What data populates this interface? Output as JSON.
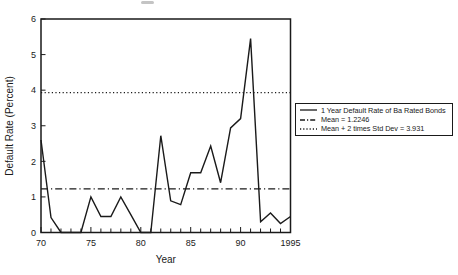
{
  "chart_data": {
    "type": "line",
    "xlabel": "Year",
    "ylabel": "Default Rate (Percent)",
    "xlim": [
      1970,
      1995
    ],
    "ylim": [
      0,
      6
    ],
    "x": [
      1970,
      1971,
      1972,
      1973,
      1974,
      1975,
      1976,
      1977,
      1978,
      1979,
      1980,
      1981,
      1982,
      1983,
      1984,
      1985,
      1986,
      1987,
      1988,
      1989,
      1990,
      1991,
      1992,
      1993,
      1994,
      1995
    ],
    "values": [
      2.6,
      0.42,
      0,
      0,
      0,
      1.0,
      0.45,
      0.45,
      1.0,
      0.5,
      0,
      0,
      2.72,
      0.89,
      0.78,
      1.68,
      1.68,
      2.43,
      1.4,
      2.94,
      3.2,
      5.45,
      0.3,
      0.55,
      0.25,
      0.45
    ],
    "xticks": {
      "years": [
        1970,
        1975,
        1980,
        1985,
        1990,
        1995
      ],
      "labels": [
        "70",
        "75",
        "80",
        "85",
        "90",
        "1995"
      ]
    },
    "yticks": [
      "0",
      "1",
      "2",
      "3",
      "4",
      "5",
      "6"
    ],
    "grid": "off",
    "line_color": "#1a1a1a",
    "reference_lines": [
      {
        "name": "mean-line",
        "value": 1.2246,
        "style": "dashdot",
        "label": "Mean = 1.2246"
      },
      {
        "name": "std-dev-line",
        "value": 3.931,
        "style": "dotted",
        "label": "Mean + 2 times Std Dev = 3.931"
      }
    ],
    "legend": {
      "position": "outside-right",
      "entries": [
        {
          "label": "1 Year Default Rate of Ba Rated Bonds",
          "style": "solid"
        },
        {
          "label": "Mean = 1.2246",
          "style": "dashdot"
        },
        {
          "label": "Mean + 2 times Std Dev = 3.931",
          "style": "dotted"
        }
      ]
    }
  }
}
